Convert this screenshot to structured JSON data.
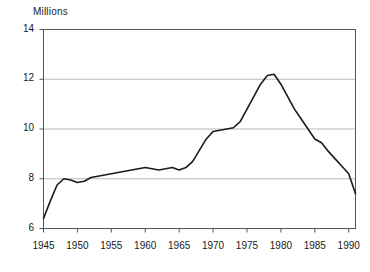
{
  "chart_data": {
    "type": "line",
    "title": "",
    "axis_unit_label": "Millions",
    "xlabel": "",
    "ylabel": "",
    "xlim": [
      1945,
      1991
    ],
    "ylim": [
      6,
      14
    ],
    "yticks": [
      6,
      8,
      10,
      12,
      14
    ],
    "xticks": [
      1945,
      1950,
      1955,
      1960,
      1965,
      1970,
      1975,
      1980,
      1985,
      1990
    ],
    "gridlines": {
      "horizontal": [
        8,
        10,
        12
      ],
      "vertical": false
    },
    "legend": null,
    "line_color": "#1a1a1a",
    "grid_color": "#b3b3b3",
    "frame_color": "#555555",
    "series": [
      {
        "name": "Millions",
        "x": [
          1945,
          1946,
          1947,
          1948,
          1949,
          1950,
          1951,
          1952,
          1953,
          1954,
          1955,
          1956,
          1957,
          1958,
          1959,
          1960,
          1961,
          1962,
          1963,
          1964,
          1965,
          1966,
          1967,
          1968,
          1969,
          1970,
          1971,
          1972,
          1973,
          1974,
          1975,
          1976,
          1977,
          1978,
          1979,
          1980,
          1981,
          1982,
          1983,
          1984,
          1985,
          1986,
          1987,
          1988,
          1989,
          1990,
          1991
        ],
        "values": [
          6.4,
          7.1,
          7.75,
          8.0,
          7.95,
          7.85,
          7.9,
          8.05,
          8.1,
          8.15,
          8.2,
          8.25,
          8.3,
          8.35,
          8.4,
          8.45,
          8.4,
          8.35,
          8.4,
          8.45,
          8.35,
          8.45,
          8.7,
          9.15,
          9.6,
          9.9,
          9.95,
          10.0,
          10.05,
          10.3,
          10.8,
          11.3,
          11.8,
          12.15,
          12.2,
          11.8,
          11.3,
          10.8,
          10.4,
          10.0,
          9.6,
          9.45,
          9.1,
          8.8,
          8.5,
          8.2,
          7.4
        ]
      }
    ]
  }
}
